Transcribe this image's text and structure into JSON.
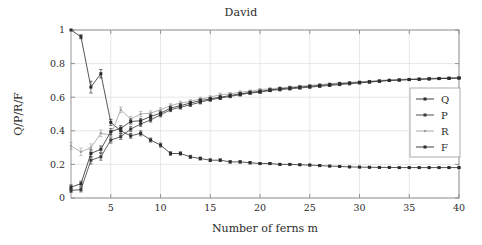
{
  "chart_data": {
    "type": "line",
    "title": "David",
    "xlabel": "Number of ferns m",
    "ylabel": "Q/P/R/F",
    "xlim": [
      1,
      40
    ],
    "ylim": [
      0,
      1
    ],
    "grid": true,
    "legend_position": "right-middle",
    "xticks": [
      5,
      10,
      15,
      20,
      25,
      30,
      35,
      40
    ],
    "xtick_labels": [
      "5",
      "10",
      "15",
      "20",
      "25",
      "30",
      "35",
      "40"
    ],
    "yticks": [
      0,
      0.2,
      0.4,
      0.6,
      0.8,
      1
    ],
    "ytick_labels": [
      "0",
      "0.2",
      "0.4",
      "0.6",
      "0.8",
      "1"
    ],
    "x": [
      1,
      2,
      3,
      4,
      5,
      6,
      7,
      8,
      9,
      10,
      11,
      12,
      13,
      14,
      15,
      16,
      17,
      18,
      19,
      20,
      21,
      22,
      23,
      24,
      25,
      26,
      27,
      28,
      29,
      30,
      31,
      32,
      33,
      34,
      35,
      36,
      37,
      38,
      39,
      40
    ],
    "series": [
      {
        "name": "Q",
        "color": "#2b2b2b",
        "marker": "square",
        "values": [
          1.0,
          0.96,
          0.66,
          0.74,
          0.45,
          0.4,
          0.37,
          0.385,
          0.345,
          0.315,
          0.265,
          0.265,
          0.245,
          0.235,
          0.225,
          0.225,
          0.215,
          0.215,
          0.21,
          0.205,
          0.205,
          0.2,
          0.2,
          0.198,
          0.196,
          0.193,
          0.19,
          0.188,
          0.185,
          0.184,
          0.183,
          0.182,
          0.182,
          0.181,
          0.181,
          0.181,
          0.181,
          0.181,
          0.181,
          0.181
        ],
        "errors": [
          0.0,
          0.012,
          0.035,
          0.025,
          0.018,
          0.016,
          0.014,
          0.015,
          0.012,
          0.012,
          0.011,
          0.01,
          0.009,
          0.009,
          0.008,
          0.008,
          0.007,
          0.007,
          0.007,
          0.006,
          0.006,
          0.006,
          0.005,
          0.005,
          0.005,
          0.005,
          0.004,
          0.004,
          0.004,
          0.004,
          0.004,
          0.003,
          0.003,
          0.003,
          0.003,
          0.003,
          0.003,
          0.003,
          0.003,
          0.003
        ]
      },
      {
        "name": "P",
        "color": "#3a3a3a",
        "marker": "square",
        "values": [
          0.045,
          0.05,
          0.225,
          0.245,
          0.345,
          0.365,
          0.41,
          0.44,
          0.465,
          0.495,
          0.525,
          0.54,
          0.555,
          0.57,
          0.585,
          0.595,
          0.605,
          0.615,
          0.625,
          0.63,
          0.64,
          0.645,
          0.65,
          0.655,
          0.66,
          0.665,
          0.67,
          0.675,
          0.68,
          0.685,
          0.69,
          0.695,
          0.7,
          0.703,
          0.705,
          0.707,
          0.709,
          0.711,
          0.713,
          0.715
        ],
        "errors": [
          0.012,
          0.014,
          0.022,
          0.02,
          0.018,
          0.016,
          0.015,
          0.014,
          0.013,
          0.012,
          0.011,
          0.011,
          0.01,
          0.01,
          0.009,
          0.009,
          0.008,
          0.008,
          0.008,
          0.007,
          0.007,
          0.007,
          0.006,
          0.006,
          0.006,
          0.006,
          0.005,
          0.005,
          0.005,
          0.005,
          0.005,
          0.004,
          0.004,
          0.004,
          0.004,
          0.004,
          0.004,
          0.004,
          0.004,
          0.004
        ]
      },
      {
        "name": "R",
        "color": "#a0a0a0",
        "marker": "dot",
        "values": [
          0.31,
          0.275,
          0.3,
          0.385,
          0.375,
          0.525,
          0.47,
          0.5,
          0.505,
          0.525,
          0.55,
          0.565,
          0.575,
          0.59,
          0.6,
          0.615,
          0.62,
          0.63,
          0.635,
          0.645,
          0.65,
          0.655,
          0.66,
          0.665,
          0.67,
          0.675,
          0.68,
          0.685,
          0.688,
          0.692,
          0.695,
          0.7,
          0.703,
          0.706,
          0.708,
          0.71,
          0.712,
          0.714,
          0.716,
          0.718
        ],
        "errors": [
          0.02,
          0.022,
          0.022,
          0.02,
          0.018,
          0.017,
          0.016,
          0.015,
          0.013,
          0.012,
          0.011,
          0.011,
          0.01,
          0.01,
          0.009,
          0.009,
          0.008,
          0.008,
          0.008,
          0.007,
          0.007,
          0.007,
          0.006,
          0.006,
          0.006,
          0.006,
          0.005,
          0.005,
          0.005,
          0.005,
          0.005,
          0.004,
          0.004,
          0.004,
          0.004,
          0.004,
          0.004,
          0.004,
          0.004,
          0.004
        ]
      },
      {
        "name": "F",
        "color": "#2b2b2b",
        "marker": "square",
        "values": [
          0.065,
          0.085,
          0.265,
          0.29,
          0.395,
          0.415,
          0.455,
          0.46,
          0.485,
          0.505,
          0.535,
          0.55,
          0.565,
          0.58,
          0.59,
          0.6,
          0.61,
          0.62,
          0.628,
          0.635,
          0.643,
          0.65,
          0.655,
          0.66,
          0.665,
          0.67,
          0.675,
          0.68,
          0.684,
          0.688,
          0.692,
          0.696,
          0.7,
          0.702,
          0.705,
          0.707,
          0.709,
          0.711,
          0.712,
          0.714
        ],
        "errors": [
          0.013,
          0.015,
          0.022,
          0.02,
          0.018,
          0.016,
          0.015,
          0.014,
          0.013,
          0.012,
          0.011,
          0.011,
          0.01,
          0.01,
          0.009,
          0.009,
          0.008,
          0.008,
          0.008,
          0.007,
          0.007,
          0.007,
          0.006,
          0.006,
          0.006,
          0.006,
          0.005,
          0.005,
          0.005,
          0.005,
          0.005,
          0.004,
          0.004,
          0.004,
          0.004,
          0.004,
          0.004,
          0.004,
          0.004,
          0.004
        ]
      }
    ],
    "legend_entries": [
      "Q",
      "P",
      "R",
      "F"
    ]
  }
}
